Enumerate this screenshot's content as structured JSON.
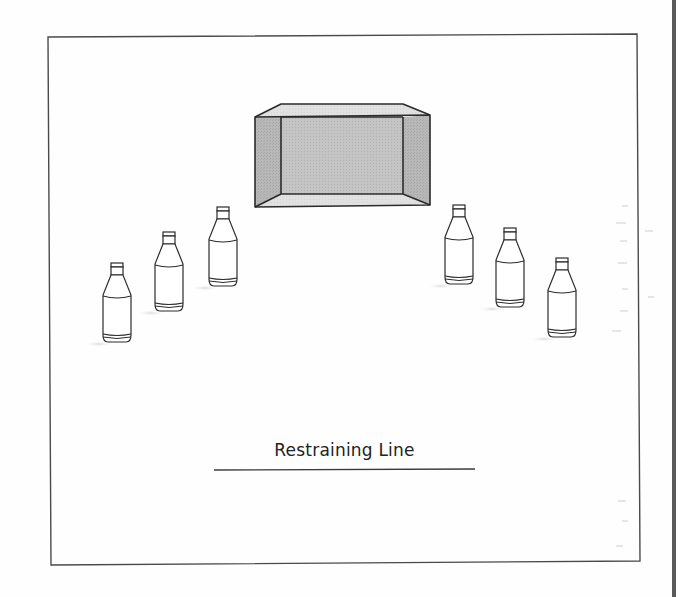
{
  "figure": {
    "restraining_line_label": "Restraining Line",
    "box": {
      "outer": {
        "x1": 255,
        "y1": 117,
        "x2": 430,
        "y2": 207
      },
      "inner": {
        "x1": 281,
        "y1": 117,
        "x2": 403,
        "y2": 194
      },
      "top_back_y": 104,
      "fill_side": "#b9b9b9",
      "fill_back": "#c9c9c9",
      "fill_top_bottom": "#e2e2e2"
    },
    "bottles": [
      {
        "id": 1,
        "x": 102,
        "y": 263
      },
      {
        "id": 2,
        "x": 154,
        "y": 232
      },
      {
        "id": 3,
        "x": 208,
        "y": 207
      },
      {
        "id": 4,
        "x": 444,
        "y": 205
      },
      {
        "id": 5,
        "x": 495,
        "y": 228
      },
      {
        "id": 6,
        "x": 547,
        "y": 258
      }
    ],
    "colors": {
      "stroke": "#2b2b2b",
      "frame": "#4a4a4a",
      "shadow": "#dcdcdc"
    }
  }
}
